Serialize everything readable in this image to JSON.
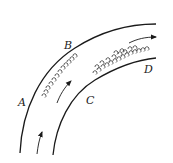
{
  "diagram": {
    "type": "curved channel flow with vortices",
    "labels": {
      "A": "A",
      "B": "B",
      "C": "C",
      "D": "D"
    },
    "colors": {
      "stroke": "#1a1a1a",
      "background": "#ffffff"
    },
    "elements": {
      "outer_wall": "outer curved boundary (A to B)",
      "inner_wall": "inner curved boundary (C to D)",
      "flow_arrows": 3,
      "vortices_outer": "small eddies along outer wall between A and B",
      "vortices_inner": "eddy cluster along inner wall between C and D"
    }
  }
}
